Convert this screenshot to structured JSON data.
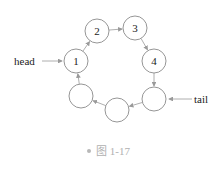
{
  "diagram": {
    "type": "circular-linked-list",
    "nodes": [
      {
        "id": "n1",
        "label": "1",
        "cx": 76,
        "cy": 61
      },
      {
        "id": "n2",
        "label": "2",
        "cx": 97,
        "cy": 31
      },
      {
        "id": "n3",
        "label": "3",
        "cx": 135,
        "cy": 28
      },
      {
        "id": "n4",
        "label": "4",
        "cx": 154,
        "cy": 61
      },
      {
        "id": "n5",
        "label": "",
        "cx": 154,
        "cy": 99
      },
      {
        "id": "n6",
        "label": "",
        "cx": 117,
        "cy": 110
      },
      {
        "id": "n7",
        "label": "",
        "cx": 81,
        "cy": 96
      }
    ],
    "edges": [
      {
        "from": "n1",
        "to": "n2"
      },
      {
        "from": "n2",
        "to": "n3"
      },
      {
        "from": "n3",
        "to": "n4"
      },
      {
        "from": "n4",
        "to": "n5"
      },
      {
        "from": "n5",
        "to": "n6"
      },
      {
        "from": "n6",
        "to": "n7"
      },
      {
        "from": "n7",
        "to": "n1"
      }
    ],
    "pointers": {
      "head": {
        "label": "head",
        "target": "n1"
      },
      "tail": {
        "label": "tail",
        "target": "n5"
      }
    },
    "colors": {
      "stroke": "#8a8a8a",
      "arrow": "#9a9a9a",
      "text": "#222222"
    }
  },
  "caption": "图 1-17"
}
